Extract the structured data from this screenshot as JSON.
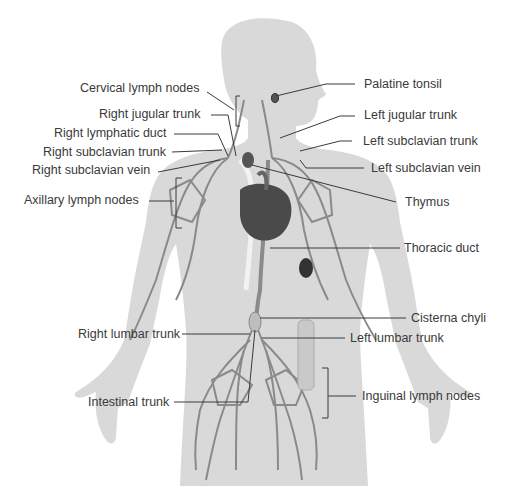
{
  "diagram": {
    "colors": {
      "background": "#ffffff",
      "silhouette": "#d9d9d9",
      "vessel": "#8a8a8a",
      "node": "#e6e6e6",
      "organ_dark": "#4a4a4a",
      "leader_line": "#3a3a3a",
      "text": "#3a3a3a"
    },
    "labels_left": [
      {
        "id": "cervical-lymph-nodes",
        "text": "Cervical lymph nodes"
      },
      {
        "id": "right-jugular-trunk",
        "text": "Right jugular trunk"
      },
      {
        "id": "right-lymphatic-duct",
        "text": "Right lymphatic duct"
      },
      {
        "id": "right-subclavian-trunk",
        "text": "Right subclavian trunk"
      },
      {
        "id": "right-subclavian-vein",
        "text": "Right subclavian vein"
      },
      {
        "id": "axillary-lymph-nodes",
        "text": "Axillary lymph nodes"
      },
      {
        "id": "right-lumbar-trunk",
        "text": "Right lumbar trunk"
      },
      {
        "id": "intestinal-trunk",
        "text": "Intestinal trunk"
      }
    ],
    "labels_right": [
      {
        "id": "palatine-tonsil",
        "text": "Palatine tonsil"
      },
      {
        "id": "left-jugular-trunk",
        "text": "Left jugular trunk"
      },
      {
        "id": "left-subclavian-trunk",
        "text": "Left subclavian trunk"
      },
      {
        "id": "left-subclavian-vein",
        "text": "Left subclavian vein"
      },
      {
        "id": "thymus",
        "text": "Thymus"
      },
      {
        "id": "thoracic-duct",
        "text": "Thoracic duct"
      },
      {
        "id": "cisterna-chyli",
        "text": "Cisterna chyli"
      },
      {
        "id": "left-lumbar-trunk",
        "text": "Left lumbar trunk"
      },
      {
        "id": "inguinal-lymph-nodes",
        "text": "Inguinal lymph nodes"
      }
    ]
  }
}
